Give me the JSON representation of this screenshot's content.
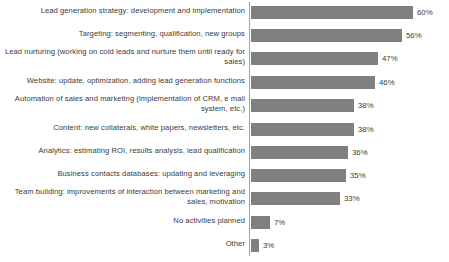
{
  "chart_data": {
    "type": "bar",
    "orientation": "horizontal",
    "title": "",
    "subtitle": "",
    "xlabel": "",
    "ylabel": "",
    "xlim": [
      0,
      60
    ],
    "grid": false,
    "legend": false,
    "bar_color": "#808080",
    "axis_color": "#a6a6a6",
    "text_color": "#3a3a3a",
    "value_suffix": "%",
    "categories": [
      "Lead generation strategy: development and implementation",
      "Targeting: segmenting, qualification, new groups",
      "Lead nurturing (working on cold leads and nurture them until ready for sales)",
      "Website: update, optimization, adding lead generation functions",
      "Automation of sales and marketing (implementation of CRM, e mail system, etc.)",
      "Content: new collaterals, white papers, newsletters, etc.",
      "Analytics: estimating ROI, results analysis, lead qualification",
      "Business contacts databases: updating and leveraging",
      "Team building: improvements of interaction between marketing and sales, motivation",
      "No activities planned",
      "Other"
    ],
    "values": [
      60,
      56,
      47,
      46,
      38,
      38,
      36,
      35,
      33,
      7,
      3
    ],
    "value_labels": [
      "60%",
      "56%",
      "47%",
      "46%",
      "38%",
      "38%",
      "36%",
      "35%",
      "33%",
      "7%",
      "3%"
    ],
    "rows": [
      {
        "label": "Lead generation strategy: development and implementation",
        "value": 60,
        "value_label": "60%",
        "top": 6,
        "label_top": 6,
        "lines": 1
      },
      {
        "label": "Targeting: segmenting, qualification, new groups",
        "value": 56,
        "value_label": "56%",
        "top": 29,
        "label_top": 29,
        "lines": 1
      },
      {
        "label": "Lead nurturing (working on cold leads and nurture them until ready for sales)",
        "value": 47,
        "value_label": "47%",
        "top": 52,
        "label_top": 47,
        "lines": 2
      },
      {
        "label": "Website: update, optimization, adding lead generation functions",
        "value": 46,
        "value_label": "46%",
        "top": 76,
        "label_top": 76,
        "lines": 1
      },
      {
        "label": "Automation of sales and marketing (implementation of CRM, e mail system, etc.)",
        "value": 38,
        "value_label": "38%",
        "top": 99,
        "label_top": 94,
        "lines": 2
      },
      {
        "label": "Content: new collaterals, white papers, newsletters, etc.",
        "value": 38,
        "value_label": "38%",
        "top": 123,
        "label_top": 123,
        "lines": 1
      },
      {
        "label": "Analytics: estimating ROI, results analysis, lead qualification",
        "value": 36,
        "value_label": "36%",
        "top": 146,
        "label_top": 146,
        "lines": 1
      },
      {
        "label": "Business contacts databases: updating and leveraging",
        "value": 35,
        "value_label": "35%",
        "top": 169,
        "label_top": 169,
        "lines": 1
      },
      {
        "label": "Team building: improvements of interaction between marketing and sales, motivation",
        "value": 33,
        "value_label": "33%",
        "top": 192,
        "label_top": 187,
        "lines": 2
      },
      {
        "label": "No activities planned",
        "value": 7,
        "value_label": "7%",
        "top": 216,
        "label_top": 216,
        "lines": 1
      },
      {
        "label": "Other",
        "value": 3,
        "value_label": "3%",
        "top": 239,
        "label_top": 239,
        "lines": 1
      }
    ],
    "scale_px_per_unit": 2.7
  }
}
